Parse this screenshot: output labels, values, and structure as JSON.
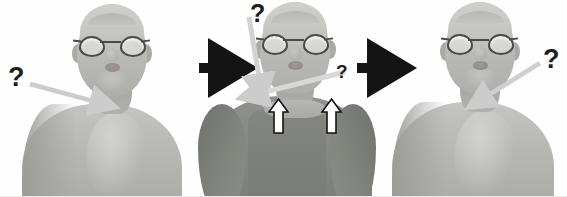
{
  "figure": {
    "panel_count": 3,
    "background_color": "#fefefe",
    "flow": "left-to-right"
  },
  "palette": {
    "skin": "#b9bab5",
    "skin_shadow": "#9a9b96",
    "skin_light": "#cfd0cb",
    "shirt": "#8a8c88",
    "shirt_shadow": "#747672",
    "glasses_frame": "#4a4a4a",
    "lens_fill": "#e1e1de",
    "gray_arrow": "#cccccc",
    "gray_arrow_edge": "#bdbdbd",
    "black_arrow": "#141414",
    "white_arrow_fill": "#ffffff",
    "white_arrow_outline": "#121212",
    "question_mark": "#1d1d1d"
  },
  "panels": [
    {
      "id": "panel-1",
      "name": "before-dressing",
      "label": "Bare torso, shirt not yet on",
      "character": {
        "pose": "front-facing bust",
        "wearing_shirt": false,
        "glasses": true,
        "bald": true
      },
      "annotations": [
        {
          "kind": "question-mark",
          "name": "question-mark-left",
          "text": "?",
          "x": 8,
          "y": 66,
          "size": 26
        },
        {
          "kind": "gray-arrow",
          "name": "gray-arrow-to-chest",
          "from": [
            30,
            84
          ],
          "to": [
            110,
            106
          ],
          "points_at": "chest"
        }
      ]
    },
    {
      "id": "panel-2",
      "name": "during-dressing",
      "label": "Shirt pulled on, pulled upward at shoulders",
      "character": {
        "pose": "front-facing bust",
        "wearing_shirt": true,
        "glasses": true,
        "bald": true
      },
      "annotations": [
        {
          "kind": "question-mark",
          "name": "question-mark-top",
          "text": "?",
          "x": 250,
          "y": 2,
          "size": 24
        },
        {
          "kind": "gray-arrow",
          "name": "gray-arrow-downward",
          "from": [
            249,
            16
          ],
          "to": [
            262,
            94
          ],
          "points_at": "left shoulder"
        },
        {
          "kind": "question-mark",
          "name": "question-mark-small-right",
          "text": "?",
          "x": 336,
          "y": 62,
          "size": 18
        },
        {
          "kind": "gray-arrow",
          "name": "gray-arrow-diagonal",
          "from": [
            344,
            72
          ],
          "to": [
            248,
            96
          ],
          "points_at": "left shoulder"
        },
        {
          "kind": "white-up-arrow",
          "name": "white-up-arrow-left",
          "x": 269,
          "y": 99,
          "width": 19,
          "height": 34,
          "points_at": "shirt shoulder seam left"
        },
        {
          "kind": "white-up-arrow",
          "name": "white-up-arrow-right",
          "x": 322,
          "y": 99,
          "width": 19,
          "height": 34,
          "points_at": "shirt shoulder seam right"
        }
      ]
    },
    {
      "id": "panel-3",
      "name": "after-removal",
      "label": "Bare torso again, shirt removed",
      "character": {
        "pose": "front-facing bust",
        "wearing_shirt": false,
        "glasses": true,
        "bald": true
      },
      "annotations": [
        {
          "kind": "question-mark",
          "name": "question-mark-right",
          "text": "?",
          "x": 543,
          "y": 48,
          "size": 26
        },
        {
          "kind": "gray-arrow",
          "name": "gray-arrow-to-neck",
          "from": [
            539,
            64
          ],
          "to": [
            474,
            104
          ],
          "points_at": "neck / shoulder"
        }
      ]
    }
  ],
  "connectors": [
    {
      "kind": "black-arrow",
      "name": "black-arrow-1",
      "from_panel": "panel-1",
      "to_panel": "panel-2",
      "x": 199,
      "y": 61,
      "width": 42,
      "height": 15
    },
    {
      "kind": "black-arrow",
      "name": "black-arrow-2",
      "from_panel": "panel-2",
      "to_panel": "panel-3",
      "x": 357,
      "y": 61,
      "width": 42,
      "height": 15
    }
  ]
}
